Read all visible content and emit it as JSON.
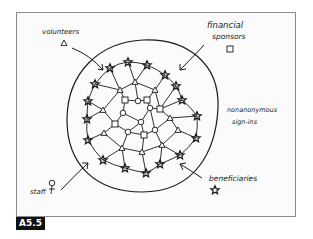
{
  "figure": {
    "label": "A5.5",
    "colors": {
      "ink": "#1a1a1a",
      "frame": "#8a8a8a",
      "label_bg": "#111111",
      "label_fg": "#ffffff",
      "paper": "#fbfbfb"
    }
  },
  "labels": {
    "volunteers": "volunteers",
    "financial_line1": "financial",
    "financial_line2": "sponsors",
    "nonanon_line1": "nonanonymous",
    "nonanon_line2": "sign-ins",
    "beneficiaries": "beneficiaries",
    "staff": "staff"
  },
  "legend": [
    {
      "group": "volunteers",
      "shape": "triangle"
    },
    {
      "group": "financial sponsors",
      "shape": "square"
    },
    {
      "group": "beneficiaries",
      "shape": "star"
    },
    {
      "group": "staff",
      "shape": "circle"
    }
  ]
}
